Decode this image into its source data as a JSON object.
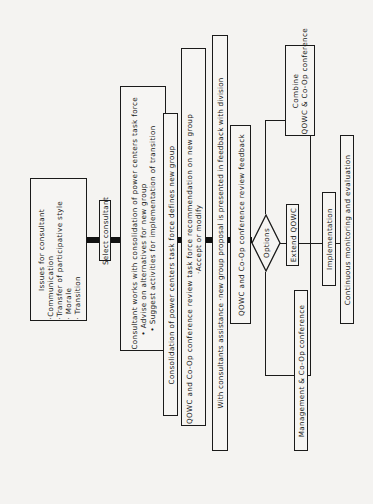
{
  "diagram": {
    "orientation": "rotated 90 degrees counter-clockwise (text reads bottom-to-top)",
    "nodes": {
      "issues": {
        "title": "Issues for consultant",
        "items": [
          "·Communication",
          "·Transfer of participative style",
          "· Morale",
          "· Transition"
        ]
      },
      "select_consultant": {
        "label": "Select consultant"
      },
      "consultant_works": {
        "title": "Consultant works with consolidation of power centers task force",
        "items": [
          "• Advise on alternatives for new group",
          "• Suggest activities for implementation of transition"
        ]
      },
      "consolidation": {
        "label": "Consolidation of power centers task force defines new group"
      },
      "qowc_review_task_force": {
        "title": "QOWC and Co-Op conference review task force recommendation on new group",
        "items": [
          "·Accept or modify"
        ]
      },
      "with_consultants": {
        "label": "With consultants assistance ·new group proposal is presented in feedback with division"
      },
      "qowc_review_feedback": {
        "label": "QOWC and Co-Op conference review feedback"
      },
      "options": {
        "label": "Options"
      },
      "combine": {
        "lines": [
          "Combine",
          "QOWC & Co-Op conference"
        ]
      },
      "extend_qowc": {
        "label": "Extend QOWC"
      },
      "management_coop": {
        "label": "Management & Co-Op conference"
      },
      "implementation": {
        "label": "Implementation"
      },
      "continuous_monitoring": {
        "label": "Continuous monitoring and evaluation"
      }
    }
  }
}
